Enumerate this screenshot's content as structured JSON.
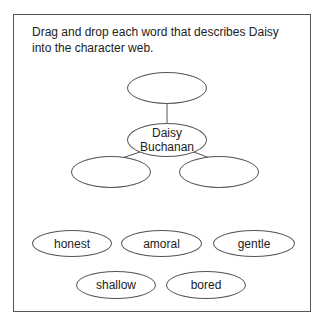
{
  "instructions": "Drag and drop each word that describes Daisy into the character web.",
  "web": {
    "center_label": "Daisy Buchanan",
    "center_line1": "Daisy",
    "center_line2": "Buchanan",
    "drop_slots": [
      {
        "id": "top",
        "value": ""
      },
      {
        "id": "left",
        "value": ""
      },
      {
        "id": "right",
        "value": ""
      }
    ]
  },
  "word_bank": [
    {
      "label": "honest"
    },
    {
      "label": "amoral"
    },
    {
      "label": "gentle"
    },
    {
      "label": "shallow"
    },
    {
      "label": "bored"
    }
  ],
  "colors": {
    "stroke": "#555555",
    "text": "#222222",
    "background": "#ffffff"
  }
}
